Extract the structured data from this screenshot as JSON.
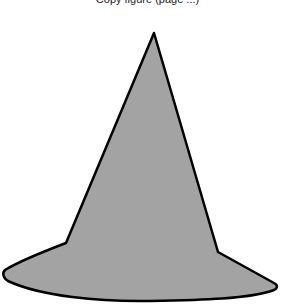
{
  "caption": {
    "text": "Copy figure (page ...)"
  },
  "figure": {
    "name": "witch-hat",
    "fill": "#a3a3a3",
    "stroke": "#000000",
    "stroke_width": 2.5
  }
}
